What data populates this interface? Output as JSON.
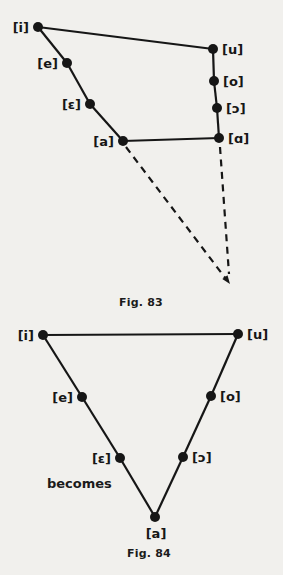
{
  "ink": "#161616",
  "paper": "#f1f0ed",
  "becomes_label": "becomes",
  "fig83": {
    "caption": "Fig. 83",
    "nodes": [
      {
        "id": "i",
        "label": "[i]",
        "x": 38,
        "y": 27,
        "label_side": "left"
      },
      {
        "id": "e",
        "label": "[e]",
        "x": 67,
        "y": 63,
        "label_side": "left"
      },
      {
        "id": "eps",
        "label": "[ɛ]",
        "x": 90,
        "y": 104,
        "label_side": "left"
      },
      {
        "id": "a",
        "label": "[a]",
        "x": 123,
        "y": 141,
        "label_side": "left"
      },
      {
        "id": "u",
        "label": "[u]",
        "x": 213,
        "y": 49,
        "label_side": "right"
      },
      {
        "id": "o",
        "label": "[o]",
        "x": 214,
        "y": 81,
        "label_side": "right"
      },
      {
        "id": "open_o",
        "label": "[ɔ]",
        "x": 217,
        "y": 108,
        "label_side": "right"
      },
      {
        "id": "alpha",
        "label": "[ɑ]",
        "x": 219,
        "y": 138,
        "label_side": "right"
      }
    ],
    "solid_edges": [
      [
        "i",
        "u"
      ],
      [
        "i",
        "e"
      ],
      [
        "e",
        "eps"
      ],
      [
        "eps",
        "a"
      ],
      [
        "u",
        "o"
      ],
      [
        "o",
        "open_o"
      ],
      [
        "open_o",
        "alpha"
      ],
      [
        "a",
        "alpha"
      ]
    ],
    "dashed_edges": [
      {
        "x1": 126,
        "y1": 147,
        "x2": 226,
        "y2": 279
      },
      {
        "x1": 220,
        "y1": 147,
        "x2": 229,
        "y2": 274
      }
    ],
    "arrowhead_points": "230,284 222.3,279.1 227.5,275.3"
  },
  "fig84": {
    "caption": "Fig. 84",
    "nodes": [
      {
        "id": "i",
        "label": "[i]",
        "x": 43,
        "y": 335,
        "label_side": "left"
      },
      {
        "id": "e",
        "label": "[e]",
        "x": 82,
        "y": 397,
        "label_side": "left"
      },
      {
        "id": "eps",
        "label": "[ɛ]",
        "x": 120,
        "y": 458,
        "label_side": "left"
      },
      {
        "id": "u",
        "label": "[u]",
        "x": 238,
        "y": 334,
        "label_side": "right"
      },
      {
        "id": "o",
        "label": "[o]",
        "x": 211,
        "y": 396,
        "label_side": "right"
      },
      {
        "id": "open_o",
        "label": "[ɔ]",
        "x": 183,
        "y": 457,
        "label_side": "right"
      },
      {
        "id": "a",
        "label": "[a]",
        "x": 155,
        "y": 517,
        "label_side": "below"
      }
    ],
    "solid_edges": [
      [
        "i",
        "u"
      ],
      [
        "i",
        "e"
      ],
      [
        "e",
        "eps"
      ],
      [
        "eps",
        "a"
      ],
      [
        "u",
        "o"
      ],
      [
        "o",
        "open_o"
      ],
      [
        "open_o",
        "a"
      ]
    ],
    "dashed_edges": [],
    "arrowhead_points": ""
  }
}
